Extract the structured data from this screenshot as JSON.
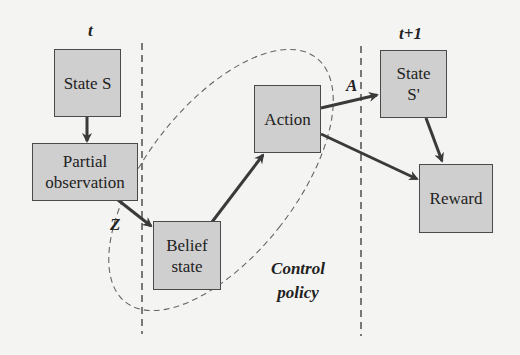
{
  "diagram": {
    "type": "flow",
    "time_labels": {
      "t": "t",
      "t_next": "t+1"
    },
    "nodes": {
      "state_s": {
        "label": "State S"
      },
      "partial_observation": {
        "line1": "Partial",
        "line2": "observation"
      },
      "belief_state": {
        "line1": "Belief",
        "line2": "state"
      },
      "action": {
        "label": "Action"
      },
      "state_s_prime": {
        "line1": "State",
        "line2": "S'"
      },
      "reward": {
        "label": "Reward"
      }
    },
    "edge_labels": {
      "z": "Z",
      "a": "A"
    },
    "group": {
      "line1": "Control",
      "line2": "policy"
    },
    "edges": [
      {
        "from": "State S",
        "to": "Partial observation"
      },
      {
        "from": "Partial observation",
        "to": "Belief state",
        "label": "Z"
      },
      {
        "from": "Belief state",
        "to": "Action"
      },
      {
        "from": "Action",
        "to": "State S'",
        "label": "A"
      },
      {
        "from": "Action",
        "to": "Reward"
      },
      {
        "from": "State S'",
        "to": "Reward"
      }
    ],
    "colors": {
      "box_fill": "#cfcfcf",
      "box_border": "#4a4a4a",
      "arrow": "#3a3a3a",
      "dashed": "#555555",
      "background": "#f4f4f2"
    }
  }
}
